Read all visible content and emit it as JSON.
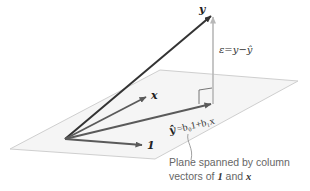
{
  "diagram": {
    "vectors": {
      "y": {
        "label": "y",
        "color": "#333333"
      },
      "x": {
        "label": "x",
        "color": "#555555"
      },
      "one": {
        "label": "1",
        "color": "#555555"
      },
      "yhat": {
        "label_lhs": "ŷ",
        "label_rhs": "=b₀1+b₁x",
        "color": "#555555"
      },
      "residual": {
        "label": "ε=y−ŷ",
        "color": "#b0b0b0"
      }
    },
    "plane": {
      "fill": "#f4f4f4",
      "stroke": "#cfcfcf"
    },
    "caption": {
      "line1": "Plane spanned by column",
      "line2_prefix": "vectors of ",
      "line2_v1": "1",
      "line2_mid": " and ",
      "line2_v2": "x"
    }
  }
}
